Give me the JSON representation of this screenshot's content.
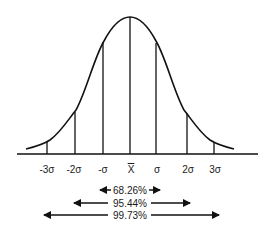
{
  "diagram": {
    "type": "normal-distribution",
    "tick_labels": [
      {
        "label": "-3σ",
        "x": 47
      },
      {
        "label": "-2σ",
        "x": 74
      },
      {
        "label": "-σ",
        "x": 103
      },
      {
        "label": "X",
        "x": 131,
        "overline": true
      },
      {
        "label": "σ",
        "x": 157
      },
      {
        "label": "2σ",
        "x": 188
      },
      {
        "label": "3σ",
        "x": 215
      }
    ],
    "ranges": [
      {
        "label": "68.26%",
        "from": "-σ",
        "to": "σ",
        "y": 190
      },
      {
        "label": "95.44%",
        "from": "-2σ",
        "to": "2σ",
        "y": 203
      },
      {
        "label": "99.73%",
        "from": "-3σ",
        "to": "3σ",
        "y": 215
      }
    ],
    "colors": {
      "line": "#111111",
      "background": "#ffffff"
    }
  }
}
